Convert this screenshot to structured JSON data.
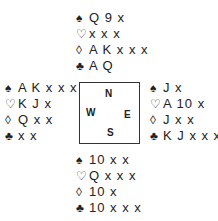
{
  "hands": {
    "north": {
      "spades": "Q 9 x",
      "hearts": "x x x",
      "diamonds": "A K x x x",
      "clubs": "A Q"
    },
    "west": {
      "spades": "A K x x x",
      "hearts": "K J x",
      "diamonds": "Q x x",
      "clubs": "x x"
    },
    "east": {
      "spades": "J x",
      "hearts": "A 10 x",
      "diamonds": "J x x",
      "clubs": "K J x x x"
    },
    "south": {
      "spades": "10 x x",
      "hearts": "Q x x x",
      "diamonds": "10 x",
      "clubs": "10 x x x"
    }
  },
  "suits": {
    "spades": "♠",
    "hearts": "♡",
    "diamonds": "◊",
    "clubs": "♣"
  },
  "compass": {
    "n": "N",
    "w": "W",
    "e": "E",
    "s": "S"
  }
}
